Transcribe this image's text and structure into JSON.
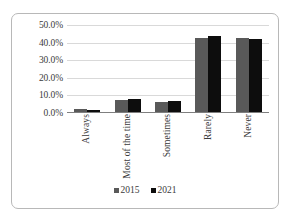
{
  "chart_data": {
    "type": "bar",
    "title": "",
    "subtitle": "",
    "xlabel": "",
    "ylabel": "",
    "categories": [
      "Always",
      "Most of the time",
      "Sometimes",
      "Rarely",
      "Never"
    ],
    "series": [
      {
        "name": "2015",
        "color": "#595959",
        "values": [
          2.0,
          7.0,
          5.7,
          42.8,
          42.6
        ]
      },
      {
        "name": "2021",
        "color": "#0D0D0D",
        "values": [
          1.3,
          7.5,
          6.3,
          43.8,
          41.7
        ]
      }
    ],
    "ylim": [
      0,
      50
    ],
    "ytick_values": [
      0,
      10,
      20,
      30,
      40,
      50
    ],
    "ytick_labels": [
      "0.0%",
      "10.0%",
      "20.0%",
      "30.0%",
      "40.0%",
      "50.0%"
    ],
    "grid": "horizontal",
    "legend_position": "bottom-center",
    "annotations": [],
    "value_format": "percent"
  },
  "axis": {
    "yticks": [
      {
        "label": "50.0%",
        "value": 50
      },
      {
        "label": "40.0%",
        "value": 40
      },
      {
        "label": "30.0%",
        "value": 30
      },
      {
        "label": "20.0%",
        "value": 20
      },
      {
        "label": "10.0%",
        "value": 10
      },
      {
        "label": "0.0%",
        "value": 0
      }
    ]
  },
  "categories": [
    {
      "label": "Always"
    },
    {
      "label": "Most of the time"
    },
    {
      "label": "Sometimes"
    },
    {
      "label": "Rarely"
    },
    {
      "label": "Never"
    }
  ],
  "legend": {
    "items": [
      {
        "label": "2015",
        "color": "#595959"
      },
      {
        "label": "2021",
        "color": "#0D0D0D"
      }
    ]
  },
  "colors": {
    "series_2015": "#595959",
    "series_2021": "#0D0D0D",
    "gridline": "#D9D9D9",
    "axis": "#7F7F7F",
    "frame_border": "#B8B8B8",
    "text": "#3B3B3B",
    "background": "#FFFFFF"
  }
}
